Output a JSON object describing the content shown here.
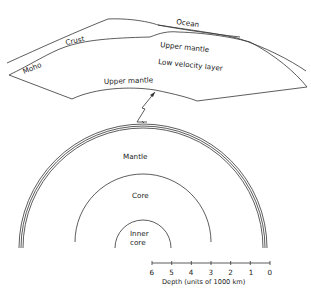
{
  "cross_section": {
    "labels": {
      "ocean": "Ocean",
      "crust": "Crust",
      "moho": "Moho",
      "upper_mantle_top": "Upper mantle",
      "low_velocity_layer": "Low velocity layer",
      "upper_mantle_bottom": "Upper mantle"
    }
  },
  "earth": {
    "labels": {
      "mantle": "Mantle",
      "core": "Core",
      "inner_core_1": "Inner",
      "inner_core_2": "core"
    }
  },
  "scale": {
    "ticks": [
      "6",
      "5",
      "4",
      "3",
      "2",
      "1",
      "0"
    ],
    "caption": "Depth (units of 1000 km)"
  },
  "colors": {
    "line": "#333333",
    "text": "#222222",
    "background": "#ffffff"
  }
}
